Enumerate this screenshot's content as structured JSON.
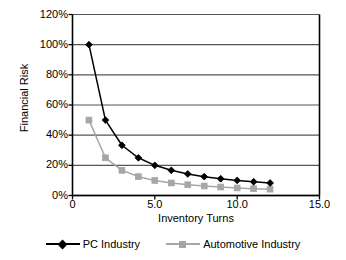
{
  "chart_data": {
    "type": "line",
    "title": "",
    "subtitle": "",
    "xlabel": "Inventory Turns",
    "ylabel": "Financial Risk",
    "xlim": [
      0,
      15
    ],
    "ylim": [
      0,
      120
    ],
    "x_tick_labels": [
      "0",
      "5.0",
      "10.0",
      "15.0"
    ],
    "x_ticks": [
      0,
      5,
      10,
      15
    ],
    "y_tick_labels": [
      "0%",
      "20%",
      "40%",
      "60%",
      "80%",
      "100%",
      "120%"
    ],
    "y_ticks": [
      0,
      20,
      40,
      60,
      80,
      100,
      120
    ],
    "grid": "horizontal",
    "legend_position": "bottom",
    "x": [
      1,
      2,
      3,
      4,
      5,
      6,
      7,
      8,
      9,
      10,
      11,
      12
    ],
    "series": [
      {
        "name": "PC Industry",
        "color": "#000000",
        "marker": "diamond",
        "values": [
          100,
          50,
          33.3,
          25,
          20,
          16.7,
          14.3,
          12.5,
          11.1,
          10,
          9.1,
          8.3
        ]
      },
      {
        "name": "Automotive Industry",
        "color": "#a6a6a6",
        "marker": "square",
        "values": [
          50,
          25,
          16.7,
          12.5,
          10,
          8.3,
          7.1,
          6.3,
          5.6,
          5,
          4.5,
          4.2
        ]
      }
    ]
  },
  "legend": {
    "entries": [
      {
        "label": "PC Industry"
      },
      {
        "label": "Automotive Industry"
      }
    ]
  },
  "colors": {
    "pc_industry": "#000000",
    "automotive_industry": "#a6a6a6",
    "axis": "#000000",
    "grid": "#555555",
    "background": "#ffffff"
  }
}
